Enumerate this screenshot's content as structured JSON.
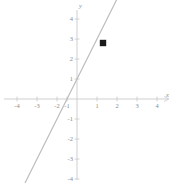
{
  "chart_data": {
    "type": "line",
    "title": "",
    "xlabel": "x",
    "ylabel": "y",
    "xlim": [
      -4.4,
      4.4
    ],
    "ylim": [
      -4.4,
      4.4
    ],
    "grid": false,
    "legend": null,
    "x_ticks": [
      -4,
      -3,
      -2,
      -1,
      1,
      2,
      3,
      4
    ],
    "y_ticks": [
      4,
      3,
      2,
      1,
      -1,
      -2,
      -3,
      -4
    ],
    "x_tick_labels": [
      "-4",
      "-3",
      "-2",
      "-1",
      "1",
      "2",
      "3",
      "4"
    ],
    "y_tick_labels": [
      "4",
      "3",
      "2",
      "1",
      "-1",
      "-2",
      "-3",
      "-4"
    ],
    "series": [
      {
        "name": "line",
        "type": "line",
        "equation": "y = 2x + 1",
        "slope": 2,
        "intercept": 1,
        "x_intercept": -0.5,
        "color": "#b9b9b9",
        "x": [
          -2.6,
          3.2
        ],
        "values": [
          -4.2,
          7.4
        ]
      },
      {
        "name": "marked-point",
        "type": "scatter",
        "color": "#1a1a1a",
        "points": [
          {
            "x": 1.3,
            "y": 2.8
          }
        ]
      }
    ],
    "axis_color": "#c2c2c2",
    "tick_color": "#c2c2c2",
    "label_color": "#8c8c8c"
  },
  "axis_labels": {
    "x_axis_name": "x",
    "y_axis_name": "y"
  }
}
